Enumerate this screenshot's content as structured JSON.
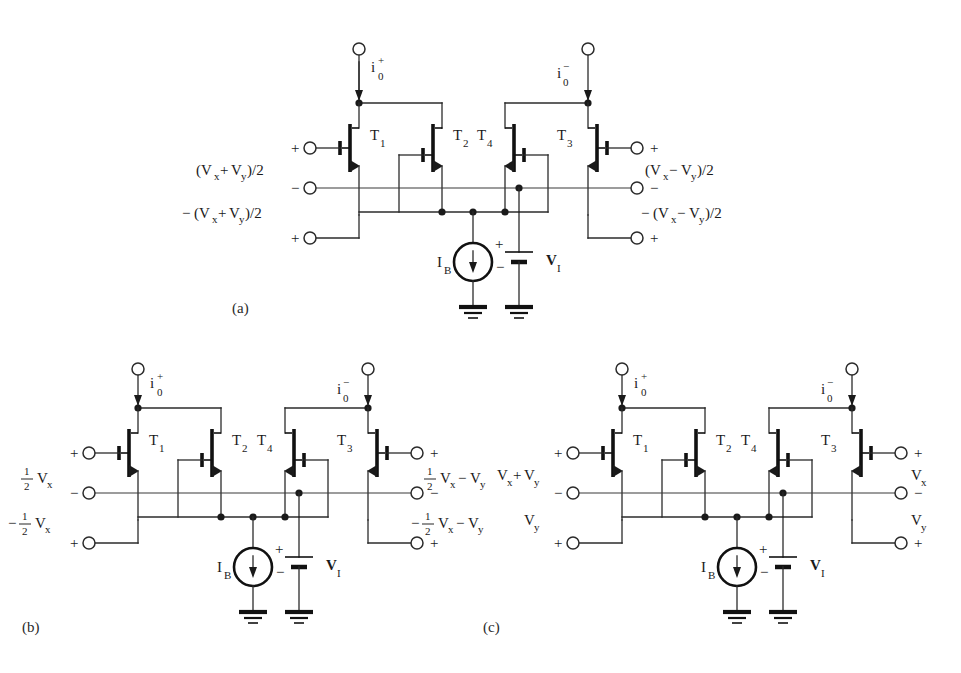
{
  "figure": {
    "background": "#ffffff",
    "ink": "#1a1a1a"
  },
  "panels": [
    {
      "id": "a",
      "caption": "(a)",
      "transistors": [
        "T",
        "T",
        "T",
        "T"
      ],
      "transistor_labels": [
        {
          "name": "T1",
          "base": "T",
          "sub": "1"
        },
        {
          "name": "T2",
          "base": "T",
          "sub": "2"
        },
        {
          "name": "T4",
          "base": "T",
          "sub": "4"
        },
        {
          "name": "T3",
          "base": "T",
          "sub": "3"
        }
      ],
      "currents": [
        {
          "name": "io-plus",
          "base": "i",
          "sub": "0",
          "sup": "+"
        },
        {
          "name": "io-minus",
          "base": "i",
          "sub": "0",
          "sup": "−"
        }
      ],
      "left_terminals": [
        {
          "sign": "+",
          "label": "(Vₓ+Vᵧ)/2"
        },
        {
          "sign": "−",
          "label": "−(Vₓ+Vᵧ)/2"
        },
        {
          "sign": "+",
          "label": ""
        }
      ],
      "right_terminals": [
        {
          "sign": "+",
          "label": "(Vₓ−Vᵧ)/2"
        },
        {
          "sign": "−",
          "label": "−(Vₓ−Vᵧ)/2"
        },
        {
          "sign": "+",
          "label": ""
        }
      ],
      "left_expr_top": {
        "open": "(V",
        "s1": "x",
        "op": "+",
        "m": "V",
        "s2": "y",
        "close": ")/2"
      },
      "left_expr_bot": {
        "neg": "−",
        "open": "(V",
        "s1": "x",
        "op": "+",
        "m": "V",
        "s2": "y",
        "close": ")/2"
      },
      "right_expr_top": {
        "open": "(V",
        "s1": "x",
        "op": "−",
        "m": "V",
        "s2": "y",
        "close": ")/2"
      },
      "right_expr_bot": {
        "neg": "−",
        "open": "(V",
        "s1": "x",
        "op": "−",
        "m": "V",
        "s2": "y",
        "close": ")/2"
      },
      "current_source": {
        "name": "IB",
        "base": "I",
        "sub": "B",
        "direction": "down"
      },
      "battery": {
        "name": "VI",
        "base": "V",
        "sub": "I",
        "plus": "+",
        "minus": "−"
      },
      "grounds": 2
    },
    {
      "id": "b",
      "caption": "(b)",
      "transistor_labels": [
        {
          "name": "T1",
          "base": "T",
          "sub": "1"
        },
        {
          "name": "T2",
          "base": "T",
          "sub": "2"
        },
        {
          "name": "T4",
          "base": "T",
          "sub": "4"
        },
        {
          "name": "T3",
          "base": "T",
          "sub": "3"
        }
      ],
      "currents": [
        {
          "name": "io-plus",
          "base": "i",
          "sub": "0",
          "sup": "+"
        },
        {
          "name": "io-minus",
          "base": "i",
          "sub": "0",
          "sup": "−"
        }
      ],
      "left_expr_top": {
        "frac_num": "1",
        "frac_den": "2",
        "v": "V",
        "sub": "x",
        "neg": ""
      },
      "left_expr_bot": {
        "neg": "−",
        "frac_num": "1",
        "frac_den": "2",
        "v": "V",
        "sub": "x"
      },
      "right_expr_top": {
        "frac_num": "1",
        "frac_den": "2",
        "v": "V",
        "sub": "x",
        "op": "−",
        "v2": "V",
        "sub2": "y"
      },
      "right_expr_bot": {
        "neg": "−",
        "frac_num": "1",
        "frac_den": "2",
        "v": "V",
        "sub": "x",
        "op": "−",
        "v2": "V",
        "sub2": "y"
      },
      "signs": {
        "lt": "+",
        "lm": "−",
        "lb": "+",
        "rt": "+",
        "rm": "−",
        "rb": "+"
      },
      "current_source": {
        "name": "IB",
        "base": "I",
        "sub": "B",
        "direction": "down"
      },
      "battery": {
        "name": "VI",
        "base": "V",
        "sub": "I",
        "plus": "+",
        "minus": "−"
      },
      "grounds": 2
    },
    {
      "id": "c",
      "caption": "(c)",
      "transistor_labels": [
        {
          "name": "T1",
          "base": "T",
          "sub": "1"
        },
        {
          "name": "T2",
          "base": "T",
          "sub": "2"
        },
        {
          "name": "T4",
          "base": "T",
          "sub": "4"
        },
        {
          "name": "T3",
          "base": "T",
          "sub": "3"
        }
      ],
      "currents": [
        {
          "name": "io-plus",
          "base": "i",
          "sub": "0",
          "sup": "+"
        },
        {
          "name": "io-minus",
          "base": "i",
          "sub": "0",
          "sup": "−"
        }
      ],
      "left_expr_top": {
        "v": "V",
        "sub": "x",
        "op": "+",
        "v2": "V",
        "sub2": "y"
      },
      "left_expr_bot": {
        "v": "V",
        "sub": "y"
      },
      "right_expr_top": {
        "v": "V",
        "sub": "x"
      },
      "right_expr_bot": {
        "v": "V",
        "sub": "y"
      },
      "signs": {
        "lt": "+",
        "lm": "−",
        "lb": "+",
        "rt": "+",
        "rm": "−",
        "rb": "+"
      },
      "current_source": {
        "name": "IB",
        "base": "I",
        "sub": "B",
        "direction": "down"
      },
      "battery": {
        "name": "VI",
        "base": "V",
        "sub": "I",
        "plus": "+",
        "minus": "−"
      },
      "grounds": 2
    }
  ],
  "glyphs": {
    "plus": "+",
    "minus": "−",
    "T": "T",
    "i": "i",
    "V": "V",
    "I": "I",
    "zero": "0",
    "one": "1",
    "two": "2",
    "B": "B",
    "sub_x": "x",
    "sub_y": "y",
    "sub_I": "I",
    "paren_open": "(",
    "paren_close": ")",
    "half_slash": "/2"
  }
}
